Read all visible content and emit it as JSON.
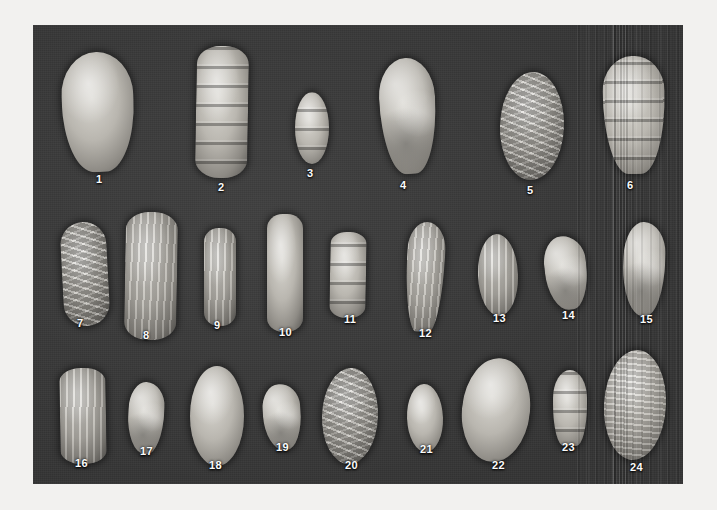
{
  "plate": {
    "background_color": "#343434",
    "page_background_color": "#f2f1ef",
    "label_color": "#fbfbfb",
    "caption": "",
    "specimen_count": 24,
    "rows": 3,
    "artifact": "vertical-scan-lines-right-side"
  },
  "specimens": [
    {
      "number": "1",
      "row": 1,
      "x": 62,
      "y": 52,
      "w": 72,
      "h": 120,
      "shape": "pyriform",
      "texture": "smooth",
      "label_x": 96,
      "label_y": 174,
      "rot": -2
    },
    {
      "number": "2",
      "row": 1,
      "x": 196,
      "y": 46,
      "w": 52,
      "h": 132,
      "shape": "elongate",
      "texture": "segmented",
      "label_x": 218,
      "label_y": 182,
      "rot": 1
    },
    {
      "number": "3",
      "row": 1,
      "x": 295,
      "y": 92,
      "w": 34,
      "h": 72,
      "shape": "ovate",
      "texture": "segmented",
      "label_x": 307,
      "label_y": 168,
      "rot": 0
    },
    {
      "number": "4",
      "row": 1,
      "x": 380,
      "y": 58,
      "w": 56,
      "h": 116,
      "shape": "clavate",
      "texture": "lumpy",
      "label_x": 400,
      "label_y": 180,
      "rot": -3
    },
    {
      "number": "5",
      "row": 1,
      "x": 500,
      "y": 72,
      "w": 64,
      "h": 108,
      "shape": "ovate",
      "texture": "chevron-ribs",
      "label_x": 527,
      "label_y": 185,
      "rot": 2
    },
    {
      "number": "6",
      "row": 1,
      "x": 603,
      "y": 56,
      "w": 62,
      "h": 118,
      "shape": "tapered",
      "texture": "segmented",
      "label_x": 627,
      "label_y": 180,
      "rot": -1
    },
    {
      "number": "7",
      "row": 2,
      "x": 62,
      "y": 222,
      "w": 46,
      "h": 104,
      "shape": "fusiform",
      "texture": "chevron-ribs",
      "label_x": 77,
      "label_y": 318,
      "rot": -3
    },
    {
      "number": "8",
      "row": 2,
      "x": 125,
      "y": 212,
      "w": 52,
      "h": 128,
      "shape": "elongate",
      "texture": "vertical-ribs",
      "label_x": 143,
      "label_y": 330,
      "rot": 1
    },
    {
      "number": "9",
      "row": 2,
      "x": 204,
      "y": 228,
      "w": 32,
      "h": 98,
      "shape": "elongate",
      "texture": "vertical-ribs",
      "label_x": 214,
      "label_y": 320,
      "rot": 0
    },
    {
      "number": "10",
      "row": 2,
      "x": 267,
      "y": 214,
      "w": 36,
      "h": 118,
      "shape": "cylindric",
      "texture": "smooth",
      "label_x": 279,
      "label_y": 327,
      "rot": 0
    },
    {
      "number": "11",
      "row": 2,
      "x": 330,
      "y": 232,
      "w": 36,
      "h": 86,
      "shape": "elongate",
      "texture": "segmented",
      "label_x": 344,
      "label_y": 314,
      "rot": 1
    },
    {
      "number": "12",
      "row": 2,
      "x": 406,
      "y": 222,
      "w": 38,
      "h": 110,
      "shape": "lanceolate",
      "texture": "vertical-ribs",
      "label_x": 419,
      "label_y": 328,
      "rot": 3
    },
    {
      "number": "13",
      "row": 2,
      "x": 478,
      "y": 234,
      "w": 40,
      "h": 82,
      "shape": "ovate",
      "texture": "vertical-ribs",
      "label_x": 493,
      "label_y": 313,
      "rot": -2
    },
    {
      "number": "14",
      "row": 2,
      "x": 545,
      "y": 236,
      "w": 42,
      "h": 74,
      "shape": "irregular",
      "texture": "lumpy",
      "label_x": 562,
      "label_y": 310,
      "rot": -6
    },
    {
      "number": "15",
      "row": 2,
      "x": 623,
      "y": 222,
      "w": 42,
      "h": 94,
      "shape": "irregular",
      "texture": "lumpy",
      "label_x": 640,
      "label_y": 314,
      "rot": 2
    },
    {
      "number": "16",
      "row": 3,
      "x": 60,
      "y": 368,
      "w": 46,
      "h": 96,
      "shape": "elongate",
      "texture": "vertical-ribs",
      "label_x": 75,
      "label_y": 458,
      "rot": -1
    },
    {
      "number": "17",
      "row": 3,
      "x": 128,
      "y": 382,
      "w": 36,
      "h": 72,
      "shape": "irregular",
      "texture": "lumpy",
      "label_x": 140,
      "label_y": 446,
      "rot": 3
    },
    {
      "number": "18",
      "row": 3,
      "x": 190,
      "y": 366,
      "w": 54,
      "h": 100,
      "shape": "ovate",
      "texture": "smooth",
      "label_x": 209,
      "label_y": 460,
      "rot": 0
    },
    {
      "number": "19",
      "row": 3,
      "x": 263,
      "y": 384,
      "w": 38,
      "h": 66,
      "shape": "irregular",
      "texture": "lumpy",
      "label_x": 276,
      "label_y": 442,
      "rot": -4
    },
    {
      "number": "20",
      "row": 3,
      "x": 322,
      "y": 368,
      "w": 56,
      "h": 96,
      "shape": "ovate",
      "texture": "chevron-ribs",
      "label_x": 345,
      "label_y": 460,
      "rot": 2
    },
    {
      "number": "21",
      "row": 3,
      "x": 407,
      "y": 384,
      "w": 36,
      "h": 68,
      "shape": "ovate",
      "texture": "smooth",
      "label_x": 420,
      "label_y": 444,
      "rot": -2
    },
    {
      "number": "22",
      "row": 3,
      "x": 462,
      "y": 358,
      "w": 68,
      "h": 104,
      "shape": "ovate",
      "texture": "smooth",
      "label_x": 492,
      "label_y": 460,
      "rot": 6
    },
    {
      "number": "23",
      "row": 3,
      "x": 553,
      "y": 370,
      "w": 34,
      "h": 76,
      "shape": "conical",
      "texture": "segmented",
      "label_x": 562,
      "label_y": 442,
      "rot": 0
    },
    {
      "number": "24",
      "row": 3,
      "x": 604,
      "y": 350,
      "w": 62,
      "h": 110,
      "shape": "ovate",
      "texture": "horizontal-ribs",
      "label_x": 630,
      "label_y": 462,
      "rot": 3
    }
  ]
}
